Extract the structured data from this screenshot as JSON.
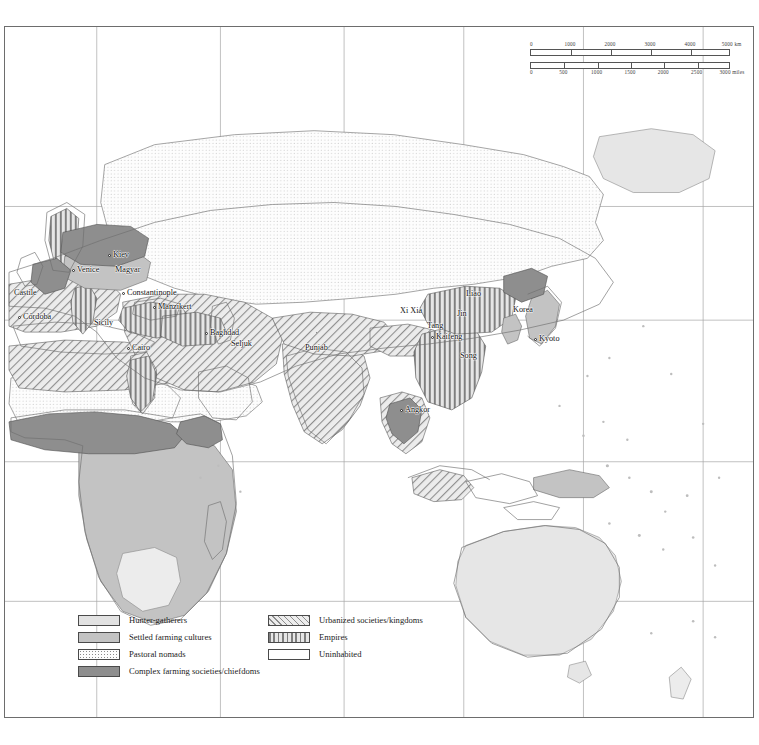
{
  "map": {
    "title": "World map of societies c.1000 CE",
    "frame": {
      "x": 4,
      "y": 26,
      "width": 750,
      "height": 692
    },
    "background_color": "#ffffff",
    "frame_color": "#6d6d6d",
    "graticule_color": "#9a9a9a"
  },
  "scalebar": {
    "km": {
      "unit": "km",
      "ticks": [
        "0",
        "1000",
        "2000",
        "3000",
        "4000",
        "5000"
      ]
    },
    "miles": {
      "unit": "miles",
      "ticks": [
        "0",
        "500",
        "1000",
        "1500",
        "2000",
        "2500",
        "3000"
      ]
    }
  },
  "legend": {
    "left_column": [
      {
        "label": "Hunter-gatherers",
        "pattern": "f-hunter",
        "color": "#e2e2e2"
      },
      {
        "label": "Settled farming cultures",
        "pattern": "f-settled",
        "color": "#c3c3c3"
      },
      {
        "label": "Pastoral nomads",
        "pattern": "f-pastoral",
        "color": "#fdfdfd"
      },
      {
        "label": "Complex farming societies/chiefdoms",
        "pattern": "f-complex",
        "color": "#8e8e8e"
      }
    ],
    "right_column": [
      {
        "label": "Urbanized societies/kingdoms",
        "pattern": "f-urban",
        "color": "#ededed"
      },
      {
        "label": "Empires",
        "pattern": "f-empire",
        "color": "#e6e6e6"
      },
      {
        "label": "Uninhabited",
        "pattern": "f-uninhab",
        "color": "#ffffff"
      }
    ]
  },
  "places": [
    {
      "name": "Castile",
      "x": 13,
      "y": 292,
      "dot": false
    },
    {
      "name": "Córdoba",
      "x": 22,
      "y": 316,
      "dot": true
    },
    {
      "name": "Venice",
      "x": 76,
      "y": 269,
      "dot": true
    },
    {
      "name": "Kiev",
      "x": 112,
      "y": 254,
      "dot": true
    },
    {
      "name": "Magyar",
      "x": 114,
      "y": 269,
      "dot": false
    },
    {
      "name": "Constantinople",
      "x": 126,
      "y": 292,
      "dot": true
    },
    {
      "name": "Manzikert",
      "x": 157,
      "y": 306,
      "dot": true
    },
    {
      "name": "Sicily",
      "x": 93,
      "y": 322,
      "dot": false
    },
    {
      "name": "Cairo",
      "x": 131,
      "y": 347,
      "dot": true
    },
    {
      "name": "Baghdad",
      "x": 209,
      "y": 332,
      "dot": true
    },
    {
      "name": "Seljuk",
      "x": 230,
      "y": 343,
      "dot": false
    },
    {
      "name": "Punjab",
      "x": 304,
      "y": 347,
      "dot": false
    },
    {
      "name": "Angkor",
      "x": 404,
      "y": 409,
      "dot": true
    },
    {
      "name": "Xi Xia",
      "x": 399,
      "y": 310,
      "dot": false
    },
    {
      "name": "Tang",
      "x": 426,
      "y": 325,
      "dot": false
    },
    {
      "name": "Kaifeng",
      "x": 435,
      "y": 336,
      "dot": true
    },
    {
      "name": "Jin",
      "x": 456,
      "y": 313,
      "dot": false
    },
    {
      "name": "Liao",
      "x": 465,
      "y": 293,
      "dot": false
    },
    {
      "name": "Song",
      "x": 459,
      "y": 355,
      "dot": false
    },
    {
      "name": "Korea",
      "x": 512,
      "y": 309,
      "dot": false
    },
    {
      "name": "Kyoto",
      "x": 538,
      "y": 338,
      "dot": true
    }
  ]
}
